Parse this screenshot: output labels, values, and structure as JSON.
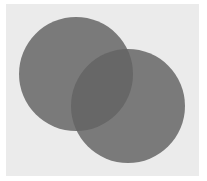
{
  "diagram": {
    "type": "venn",
    "background_color": "#ebebeb",
    "circles": [
      {
        "name": "left-circle",
        "cx": 76,
        "cy": 74,
        "r": 57,
        "color": "#7a7a7a"
      },
      {
        "name": "right-circle",
        "cx": 128,
        "cy": 106,
        "r": 57,
        "color": "#7a7a7a"
      }
    ],
    "overlap_color": "#676767"
  }
}
